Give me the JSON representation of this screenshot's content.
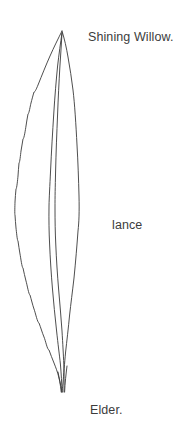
{
  "figure": {
    "name": "leaf-illustration",
    "type": "botanical-line-drawing",
    "background_color": "#ffffff",
    "ink_color": "#3a3a3a",
    "stroke_width": 0.9,
    "canvas": {
      "width": 193,
      "height": 422
    },
    "leaf": {
      "apex_point": {
        "x": 62,
        "y": 31
      },
      "base_point": {
        "x": 62,
        "y": 392
      },
      "widest_point": {
        "x": 16,
        "y": 205
      },
      "left_margin_style": "serrate",
      "right_margin_style": "entire",
      "midrib": "double-line",
      "outline_left": "M 62,31 C 52,46 43,64 36,86 C 30,106 25,128 21,150 C 18,169 16,188 15,206 C 14,226 15,246 18,265 C 22,288 28,310 36,330 C 43,347 50,362 56,374 C 59,381 61,387 62,392",
      "outline_right": "M 62,31 C 66,48 70,68 73,90 C 76,113 78,137 79,160 C 80,184 80,208 78,231 C 76,256 73,280 70,301 C 67,322 65,340 64,356 C 63,370 62,382 62,392",
      "midrib_a": "M 62,33 C 59,56 56,84 54,113 C 52,143 50,175 49,206 C 48,238 49,268 52,296 C 55,322 58,346 60,364 C 61,377 62,386 62,392",
      "midrib_b": "M 62,33 C 61,57 59,85 58,114 C 56,145 55,176 55,207 C 55,239 56,269 58,297 C 60,323 62,347 63,364 C 64,377 64,386 64,392",
      "serrations": [
        {
          "x": 34,
          "y": 92
        },
        {
          "x": 31,
          "y": 103
        },
        {
          "x": 28,
          "y": 114
        },
        {
          "x": 26,
          "y": 126
        },
        {
          "x": 23,
          "y": 139
        },
        {
          "x": 21,
          "y": 151
        },
        {
          "x": 19,
          "y": 163
        },
        {
          "x": 18,
          "y": 176
        },
        {
          "x": 16,
          "y": 189
        },
        {
          "x": 15,
          "y": 202
        },
        {
          "x": 15,
          "y": 215
        },
        {
          "x": 16,
          "y": 228
        },
        {
          "x": 18,
          "y": 241
        },
        {
          "x": 20,
          "y": 254
        },
        {
          "x": 23,
          "y": 268
        },
        {
          "x": 26,
          "y": 281
        },
        {
          "x": 30,
          "y": 295
        },
        {
          "x": 34,
          "y": 309
        },
        {
          "x": 39,
          "y": 323
        },
        {
          "x": 44,
          "y": 337
        },
        {
          "x": 49,
          "y": 350
        },
        {
          "x": 54,
          "y": 363
        }
      ]
    }
  },
  "labels": {
    "common_name": "Shining Willow.",
    "leaf_shape": "lance",
    "family_name": "Elder."
  }
}
